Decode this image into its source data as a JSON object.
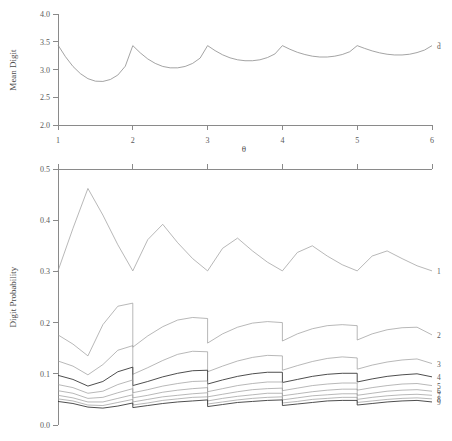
{
  "figure": {
    "width": 452,
    "height": 441,
    "background": "#ffffff",
    "ink_color": "#8a8a8a",
    "accent_color": "#3a3a3a"
  },
  "chart_data": [
    {
      "id": "mean-digit-panel",
      "type": "line",
      "title": "",
      "xlabel": "θ",
      "ylabel": "Mean Digit",
      "xlim": [
        1,
        6
      ],
      "ylim": [
        2.0,
        4.0
      ],
      "xticks": [
        1,
        2,
        3,
        4,
        5,
        6
      ],
      "xticklabels": [
        "1",
        "2",
        "3",
        "4",
        "5",
        "6"
      ],
      "yticks": [
        2.0,
        2.5,
        3.0,
        3.5,
        4.0
      ],
      "yticklabels": [
        "2.0",
        "2.5",
        "3.0",
        "3.5",
        "4.0"
      ],
      "grid": false,
      "legend_position": "right-inline",
      "series": [
        {
          "name": "d̄",
          "label": "d̄",
          "color": "#8d8d8d",
          "x": [
            1.0,
            1.1,
            1.2,
            1.3,
            1.4,
            1.5,
            1.6,
            1.7,
            1.8,
            1.9,
            2.0,
            2.0,
            2.1,
            2.2,
            2.3,
            2.4,
            2.5,
            2.6,
            2.7,
            2.8,
            2.9,
            3.0,
            3.0,
            3.1,
            3.2,
            3.3,
            3.4,
            3.5,
            3.6,
            3.7,
            3.8,
            3.9,
            4.0,
            4.0,
            4.1,
            4.2,
            4.3,
            4.4,
            4.5,
            4.6,
            4.7,
            4.8,
            4.9,
            5.0,
            5.0,
            5.1,
            5.2,
            5.3,
            5.4,
            5.5,
            5.6,
            5.7,
            5.8,
            5.9,
            6.0
          ],
          "y": [
            3.44,
            3.23,
            3.055,
            2.925,
            2.835,
            2.79,
            2.785,
            2.82,
            2.9,
            3.06,
            3.43,
            3.43,
            3.3,
            3.19,
            3.11,
            3.055,
            3.03,
            3.03,
            3.055,
            3.11,
            3.205,
            3.43,
            3.43,
            3.34,
            3.265,
            3.21,
            3.175,
            3.158,
            3.158,
            3.175,
            3.215,
            3.28,
            3.43,
            3.43,
            3.365,
            3.31,
            3.27,
            3.24,
            3.225,
            3.225,
            3.24,
            3.27,
            3.32,
            3.43,
            3.43,
            3.38,
            3.335,
            3.3,
            3.275,
            3.262,
            3.262,
            3.275,
            3.305,
            3.35,
            3.43
          ]
        }
      ]
    },
    {
      "id": "digit-probability-panel",
      "type": "line",
      "title": "",
      "xlabel": "",
      "ylabel": "Digit Probability",
      "xlim": [
        1,
        6
      ],
      "ylim": [
        0.0,
        0.5
      ],
      "xticks": [
        1,
        2,
        3,
        4,
        5,
        6
      ],
      "xticklabels": [
        "",
        "",
        "",
        "",
        "",
        ""
      ],
      "yticks": [
        0.0,
        0.1,
        0.2,
        0.3,
        0.4,
        0.5
      ],
      "yticklabels": [
        "0.0",
        "0.1",
        "0.2",
        "0.3",
        "0.4",
        "0.5"
      ],
      "grid": false,
      "legend_position": "right-inline",
      "series": [
        {
          "name": "digit-1",
          "label": "1",
          "color": "#9a9a9a",
          "emphasis": false,
          "x": [
            1.0,
            1.2,
            1.4,
            1.6,
            1.8,
            2.0,
            2.0,
            2.2,
            2.4,
            2.6,
            2.8,
            3.0,
            3.0,
            3.2,
            3.4,
            3.6,
            3.8,
            4.0,
            4.0,
            4.2,
            4.4,
            4.6,
            4.8,
            5.0,
            5.0,
            5.2,
            5.4,
            5.6,
            5.8,
            6.0
          ],
          "y": [
            0.301,
            0.384,
            0.462,
            0.41,
            0.352,
            0.301,
            0.301,
            0.362,
            0.392,
            0.356,
            0.325,
            0.301,
            0.301,
            0.345,
            0.365,
            0.34,
            0.318,
            0.301,
            0.301,
            0.337,
            0.35,
            0.33,
            0.313,
            0.301,
            0.301,
            0.33,
            0.34,
            0.325,
            0.311,
            0.301
          ]
        },
        {
          "name": "digit-2",
          "label": "2",
          "color": "#9a9a9a",
          "emphasis": false,
          "x": [
            1.0,
            1.2,
            1.4,
            1.6,
            1.8,
            2.0,
            2.0,
            2.2,
            2.4,
            2.6,
            2.8,
            3.0,
            3.0,
            3.2,
            3.4,
            3.6,
            3.8,
            4.0,
            4.0,
            4.2,
            4.4,
            4.6,
            4.8,
            5.0,
            5.0,
            5.2,
            5.4,
            5.6,
            5.8,
            6.0
          ],
          "y": [
            0.176,
            0.158,
            0.135,
            0.196,
            0.232,
            0.238,
            0.152,
            0.174,
            0.192,
            0.205,
            0.21,
            0.208,
            0.16,
            0.178,
            0.191,
            0.199,
            0.202,
            0.2,
            0.164,
            0.178,
            0.188,
            0.194,
            0.196,
            0.194,
            0.166,
            0.178,
            0.186,
            0.19,
            0.191,
            0.176
          ]
        },
        {
          "name": "digit-3",
          "label": "3",
          "color": "#9a9a9a",
          "emphasis": false,
          "x": [
            1.0,
            1.2,
            1.4,
            1.6,
            1.8,
            2.0,
            2.0,
            2.2,
            2.4,
            2.6,
            2.8,
            3.0,
            3.0,
            3.2,
            3.4,
            3.6,
            3.8,
            4.0,
            4.0,
            4.2,
            4.4,
            4.6,
            4.8,
            5.0,
            5.0,
            5.2,
            5.4,
            5.6,
            5.8,
            6.0
          ],
          "y": [
            0.125,
            0.115,
            0.098,
            0.118,
            0.146,
            0.155,
            0.099,
            0.112,
            0.126,
            0.138,
            0.144,
            0.143,
            0.104,
            0.115,
            0.125,
            0.132,
            0.136,
            0.135,
            0.107,
            0.116,
            0.124,
            0.13,
            0.133,
            0.131,
            0.109,
            0.117,
            0.123,
            0.127,
            0.129,
            0.12
          ]
        },
        {
          "name": "digit-4",
          "label": "4",
          "color": "#3a3a3a",
          "emphasis": true,
          "x": [
            1.0,
            1.2,
            1.4,
            1.6,
            1.8,
            2.0,
            2.0,
            2.2,
            2.4,
            2.6,
            2.8,
            3.0,
            3.0,
            3.2,
            3.4,
            3.6,
            3.8,
            4.0,
            4.0,
            4.2,
            4.4,
            4.6,
            4.8,
            5.0,
            5.0,
            5.2,
            5.4,
            5.6,
            5.8,
            6.0
          ],
          "y": [
            0.097,
            0.089,
            0.076,
            0.085,
            0.104,
            0.113,
            0.077,
            0.085,
            0.094,
            0.101,
            0.106,
            0.107,
            0.08,
            0.088,
            0.095,
            0.1,
            0.103,
            0.103,
            0.083,
            0.089,
            0.095,
            0.099,
            0.101,
            0.101,
            0.084,
            0.09,
            0.095,
            0.098,
            0.1,
            0.094
          ]
        },
        {
          "name": "digit-5",
          "label": "5",
          "color": "#a5a5a5",
          "emphasis": false,
          "x": [
            1.0,
            1.2,
            1.4,
            1.6,
            1.8,
            2.0,
            2.0,
            2.2,
            2.4,
            2.6,
            2.8,
            3.0,
            3.0,
            3.2,
            3.4,
            3.6,
            3.8,
            4.0,
            4.0,
            4.2,
            4.4,
            4.6,
            4.8,
            5.0,
            5.0,
            5.2,
            5.4,
            5.6,
            5.8,
            6.0
          ],
          "y": [
            0.079,
            0.073,
            0.062,
            0.066,
            0.079,
            0.088,
            0.063,
            0.069,
            0.076,
            0.081,
            0.085,
            0.086,
            0.065,
            0.071,
            0.077,
            0.081,
            0.084,
            0.084,
            0.067,
            0.072,
            0.077,
            0.08,
            0.082,
            0.082,
            0.068,
            0.073,
            0.077,
            0.08,
            0.081,
            0.077
          ]
        },
        {
          "name": "digit-6",
          "label": "6",
          "color": "#a5a5a5",
          "emphasis": false,
          "x": [
            1.0,
            1.2,
            1.4,
            1.6,
            1.8,
            2.0,
            2.0,
            2.2,
            2.4,
            2.6,
            2.8,
            3.0,
            3.0,
            3.2,
            3.4,
            3.6,
            3.8,
            4.0,
            4.0,
            4.2,
            4.4,
            4.6,
            4.8,
            5.0,
            5.0,
            5.2,
            5.4,
            5.6,
            5.8,
            6.0
          ],
          "y": [
            0.067,
            0.062,
            0.052,
            0.054,
            0.063,
            0.071,
            0.053,
            0.058,
            0.064,
            0.068,
            0.071,
            0.073,
            0.055,
            0.06,
            0.065,
            0.069,
            0.071,
            0.072,
            0.057,
            0.061,
            0.065,
            0.068,
            0.07,
            0.07,
            0.058,
            0.062,
            0.066,
            0.068,
            0.069,
            0.066
          ]
        },
        {
          "name": "digit-7",
          "label": "7",
          "color": "#aaaaaa",
          "emphasis": false,
          "x": [
            1.0,
            1.2,
            1.4,
            1.6,
            1.8,
            2.0,
            2.0,
            2.2,
            2.4,
            2.6,
            2.8,
            3.0,
            3.0,
            3.2,
            3.4,
            3.6,
            3.8,
            4.0,
            4.0,
            4.2,
            4.4,
            4.6,
            4.8,
            5.0,
            5.0,
            5.2,
            5.4,
            5.6,
            5.8,
            6.0
          ],
          "y": [
            0.058,
            0.053,
            0.045,
            0.045,
            0.052,
            0.059,
            0.045,
            0.05,
            0.055,
            0.058,
            0.061,
            0.063,
            0.047,
            0.052,
            0.056,
            0.059,
            0.062,
            0.062,
            0.049,
            0.053,
            0.057,
            0.059,
            0.061,
            0.061,
            0.05,
            0.054,
            0.057,
            0.059,
            0.06,
            0.058
          ]
        },
        {
          "name": "digit-8",
          "label": "8",
          "color": "#b0b0b0",
          "emphasis": false,
          "x": [
            1.0,
            1.2,
            1.4,
            1.6,
            1.8,
            2.0,
            2.0,
            2.2,
            2.4,
            2.6,
            2.8,
            3.0,
            3.0,
            3.2,
            3.4,
            3.6,
            3.8,
            4.0,
            4.0,
            4.2,
            4.4,
            4.6,
            4.8,
            5.0,
            5.0,
            5.2,
            5.4,
            5.6,
            5.8,
            6.0
          ],
          "y": [
            0.051,
            0.047,
            0.039,
            0.038,
            0.044,
            0.05,
            0.039,
            0.043,
            0.048,
            0.051,
            0.054,
            0.055,
            0.041,
            0.045,
            0.049,
            0.052,
            0.054,
            0.055,
            0.043,
            0.046,
            0.05,
            0.052,
            0.054,
            0.054,
            0.044,
            0.047,
            0.05,
            0.052,
            0.053,
            0.051
          ]
        },
        {
          "name": "digit-9",
          "label": "9",
          "color": "#3a3a3a",
          "emphasis": true,
          "x": [
            1.0,
            1.2,
            1.4,
            1.6,
            1.8,
            2.0,
            2.0,
            2.2,
            2.4,
            2.6,
            2.8,
            3.0,
            3.0,
            3.2,
            3.4,
            3.6,
            3.8,
            4.0,
            4.0,
            4.2,
            4.4,
            4.6,
            4.8,
            5.0,
            5.0,
            5.2,
            5.4,
            5.6,
            5.8,
            6.0
          ],
          "y": [
            0.046,
            0.042,
            0.035,
            0.033,
            0.037,
            0.043,
            0.034,
            0.038,
            0.042,
            0.045,
            0.047,
            0.049,
            0.036,
            0.04,
            0.044,
            0.046,
            0.048,
            0.049,
            0.038,
            0.041,
            0.044,
            0.047,
            0.048,
            0.048,
            0.039,
            0.042,
            0.045,
            0.047,
            0.048,
            0.045
          ]
        }
      ]
    }
  ],
  "cropped_header_text": ""
}
